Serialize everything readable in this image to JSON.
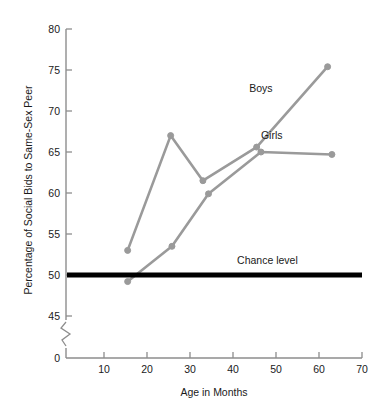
{
  "chart_data": {
    "type": "line",
    "title": "",
    "xlabel": "Age in Months",
    "ylabel": "Percentage of Social Bids to Same-Sex Peer",
    "xlim": [
      0,
      70
    ],
    "ylim": [
      43.5,
      80
    ],
    "xticks": [
      "10",
      "20",
      "30",
      "40",
      "50",
      "60",
      "70"
    ],
    "xtick_values": [
      10,
      20,
      30,
      40,
      50,
      60,
      70
    ],
    "yticks": [
      "0",
      "45",
      "50",
      "55",
      "60",
      "65",
      "70",
      "75",
      "80"
    ],
    "ytick_values": [
      0,
      45,
      50,
      55,
      60,
      65,
      70,
      75,
      80
    ],
    "grid": false,
    "axis_break": true,
    "axis_break_note": "y-axis broken between 0 and 45",
    "legend_position": "inline-labels",
    "series": [
      {
        "name": "Boys",
        "label": "Boys",
        "color": "#9a9a9a",
        "x": [
          15.5,
          25.5,
          33.0,
          45.5,
          62.0
        ],
        "values": [
          53.0,
          67.0,
          61.5,
          65.6,
          75.4
        ],
        "label_x": 46.5,
        "label_y": 72.3
      },
      {
        "name": "Girls",
        "label": "Girls",
        "color": "#9a9a9a",
        "x": [
          15.5,
          25.8,
          34.3,
          46.5,
          63.0
        ],
        "values": [
          49.2,
          53.5,
          59.9,
          65.0,
          64.7
        ],
        "label_x": 49.0,
        "label_y": 66.6
      }
    ],
    "annotations": [
      {
        "name": "chance-level",
        "text": "Chance level",
        "y": 50,
        "color": "#000000",
        "style": "thick-horizontal-line",
        "label_x": 48.0,
        "label_y": 51.3
      }
    ]
  }
}
